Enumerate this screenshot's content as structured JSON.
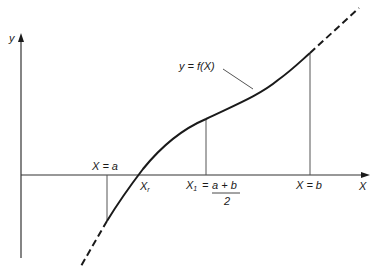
{
  "diagram": {
    "type": "function-root-bisection",
    "axes": {
      "y_label": "y",
      "x_label": "X"
    },
    "curve_label": "y = f(X)",
    "labels": {
      "x_a": "X = a",
      "x_r_main": "X",
      "x_r_sub": "r",
      "x1_main": "X",
      "x1_sub": "1",
      "x1_eq": "=",
      "x1_num": "a + b",
      "x1_den": "2",
      "x_b": "X = b"
    },
    "colors": {
      "line": "#1a1a1a",
      "axis": "#333333",
      "guide": "#555555",
      "background": "#ffffff"
    }
  }
}
